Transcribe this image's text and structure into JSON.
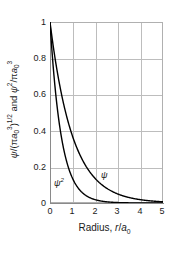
{
  "chart_data": {
    "type": "line",
    "title": "",
    "subtitle": "",
    "xlabel": "Radius, r/a0",
    "ylabel": "psi/(pi a0^3)^1/2 and psi^2/pi a0^3",
    "xlim": [
      0,
      5
    ],
    "ylim": [
      0,
      1
    ],
    "grid": true,
    "legend_position": "inline-annotation",
    "xticks": [
      "0",
      "1",
      "2",
      "3",
      "4",
      "5"
    ],
    "xtick_values": [
      0,
      1,
      2,
      3,
      4,
      5
    ],
    "yticks": [
      "0",
      "0.2",
      "0.4",
      "0.6",
      "0.8",
      "1"
    ],
    "ytick_values": [
      0,
      0.2,
      0.4,
      0.6,
      0.8,
      1
    ],
    "series": [
      {
        "name": "psi",
        "label": "ψ",
        "formula": "exp(-r)",
        "color": "#000000",
        "x": [
          0,
          0.125,
          0.25,
          0.375,
          0.5,
          0.625,
          0.75,
          0.875,
          1,
          1.25,
          1.5,
          1.75,
          2,
          2.25,
          2.5,
          2.75,
          3,
          3.25,
          3.5,
          3.75,
          4,
          4.25,
          4.5,
          4.75,
          5
        ],
        "values": [
          1,
          0.882,
          0.779,
          0.687,
          0.607,
          0.535,
          0.472,
          0.417,
          0.368,
          0.287,
          0.223,
          0.174,
          0.135,
          0.105,
          0.082,
          0.064,
          0.05,
          0.039,
          0.03,
          0.024,
          0.018,
          0.014,
          0.011,
          0.0087,
          0.0067
        ]
      },
      {
        "name": "psi-squared",
        "label": "ψ",
        "label_exponent": "2",
        "formula": "exp(-2r)",
        "color": "#000000",
        "x": [
          0,
          0.125,
          0.25,
          0.375,
          0.5,
          0.625,
          0.75,
          0.875,
          1,
          1.25,
          1.5,
          1.75,
          2,
          2.25,
          2.5,
          2.75,
          3,
          3.25,
          3.5,
          3.75,
          4,
          4.25,
          4.5,
          4.75,
          5
        ],
        "values": [
          1,
          0.779,
          0.607,
          0.472,
          0.368,
          0.287,
          0.223,
          0.174,
          0.135,
          0.082,
          0.05,
          0.03,
          0.018,
          0.011,
          0.0067,
          0.0041,
          0.0025,
          0.0015,
          0.0009,
          0.00055,
          0.00034,
          0.0002,
          0.00012,
          8e-05,
          5e-05
        ]
      }
    ],
    "annotations": [
      {
        "name": "psi-curve-label",
        "text": "ψ",
        "x": 2.1,
        "y": 0.17
      },
      {
        "name": "psi-squared-curve-label",
        "text": "ψ",
        "superscript": "2",
        "x": 0.25,
        "y": 0.12
      }
    ]
  },
  "axes": {
    "x": {
      "title_prefix": "Radius, ",
      "title_variable": "r",
      "title_slash": "/",
      "title_denominator": "a",
      "title_denominator_sub": "0",
      "ticks": [
        "0",
        "1",
        "2",
        "3",
        "4",
        "5"
      ]
    },
    "y": {
      "psi_symbol": "ψ",
      "slash": "/(",
      "pi_symbol": "π",
      "a_symbol": "a",
      "a_sub": "0",
      "a_sup": "3",
      "close_paren": ")",
      "half_power": "1/2",
      "and_text": " and ",
      "psi2_symbol": "ψ",
      "psi2_sup": "2",
      "psi2_slash": "/",
      "psi2_pi": "π",
      "psi2_a": "a",
      "psi2_a_sub": "0",
      "psi2_a_sup": "3",
      "ticks": [
        "1",
        "0.8",
        "0.6",
        "0.4",
        "0.2",
        "0"
      ]
    }
  },
  "colors": {
    "background": "#ffffff",
    "grid": "#bdbdbd",
    "axis": "#8a8a8a",
    "curve": "#000000",
    "text": "#1a1a1a"
  }
}
